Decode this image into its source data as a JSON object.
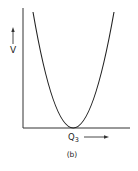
{
  "figure": {
    "caption": "(b)",
    "y_axis_label": "V",
    "x_axis_label": "Q",
    "x_axis_subscript": "3",
    "curve": "parabola with minimum at the x-axis",
    "colors": {
      "ink": "#222222",
      "background": "#ffffff"
    }
  }
}
